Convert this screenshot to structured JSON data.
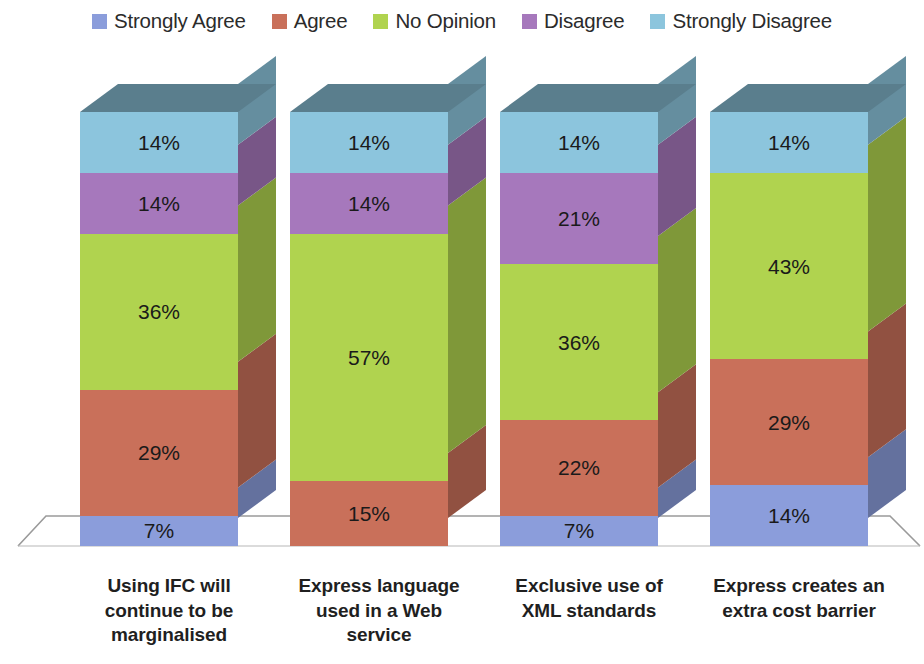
{
  "legend": {
    "position": "top",
    "items": [
      {
        "label": "Strongly Agree",
        "color": "#8b9ddb",
        "icon": "legend-swatch-icon"
      },
      {
        "label": "Agree",
        "color": "#c9705a",
        "icon": "legend-swatch-icon"
      },
      {
        "label": "No Opinion",
        "color": "#b0d34f",
        "icon": "legend-swatch-icon"
      },
      {
        "label": "Disagree",
        "color": "#a678bc",
        "icon": "legend-swatch-icon"
      },
      {
        "label": "Strongly Disagree",
        "color": "#8cc5dd",
        "icon": "legend-swatch-icon"
      }
    ]
  },
  "chart_data": {
    "type": "bar",
    "title": "",
    "subtitle": "",
    "xlabel": "",
    "ylabel": "",
    "stacked": true,
    "stack_mode": "percent",
    "orientation": "vertical",
    "style": "3d-stacked-column",
    "grid": false,
    "axis_visible": false,
    "ylim": [
      0,
      100
    ],
    "categories": [
      "Using IFC will continue to be marginalised",
      "Express language used in a Web service",
      "Exclusive use of XML standards",
      "Express creates an extra cost barrier"
    ],
    "category_lines": [
      [
        "Using IFC will",
        "continue to be",
        "marginalised"
      ],
      [
        "Express language",
        "used in a Web",
        "service"
      ],
      [
        "Exclusive use of",
        "XML standards"
      ],
      [
        "Express creates an",
        "extra cost barrier"
      ]
    ],
    "series": [
      {
        "name": "Strongly Agree",
        "color": "#8b9ddb",
        "values": [
          7,
          0,
          7,
          14
        ],
        "labels": [
          "7%",
          "",
          "7%",
          "14%"
        ]
      },
      {
        "name": "Agree",
        "color": "#c9705a",
        "values": [
          29,
          15,
          22,
          29
        ],
        "labels": [
          "29%",
          "15%",
          "22%",
          "29%"
        ]
      },
      {
        "name": "No Opinion",
        "color": "#b0d34f",
        "values": [
          36,
          57,
          36,
          43
        ],
        "labels": [
          "36%",
          "57%",
          "36%",
          "43%"
        ]
      },
      {
        "name": "Disagree",
        "color": "#a678bc",
        "values": [
          14,
          14,
          21,
          0
        ],
        "labels": [
          "14%",
          "14%",
          "21%",
          ""
        ]
      },
      {
        "name": "Strongly Disagree",
        "color": "#8cc5dd",
        "values": [
          14,
          14,
          14,
          14
        ],
        "labels": [
          "14%",
          "14%",
          "14%",
          "14%"
        ]
      }
    ]
  },
  "colors": {
    "background": "#ffffff",
    "floor_line": "#9a9a9a",
    "label_text": "#1f1f1f",
    "value_text": "#1a1a1a"
  }
}
